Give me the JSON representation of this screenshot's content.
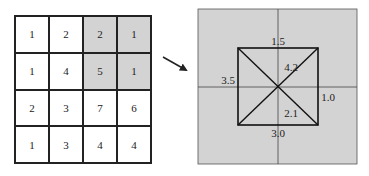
{
  "input_grid": {
    "rows": [
      [
        {
          "value": "1",
          "shaded": false
        },
        {
          "value": "2",
          "shaded": false
        },
        {
          "value": "2",
          "shaded": true
        },
        {
          "value": "1",
          "shaded": true
        }
      ],
      [
        {
          "value": "1",
          "shaded": false
        },
        {
          "value": "4",
          "shaded": false
        },
        {
          "value": "5",
          "shaded": true
        },
        {
          "value": "1",
          "shaded": true
        }
      ],
      [
        {
          "value": "2",
          "shaded": false
        },
        {
          "value": "3",
          "shaded": false
        },
        {
          "value": "7",
          "shaded": false
        },
        {
          "value": "6",
          "shaded": false
        }
      ],
      [
        {
          "value": "1",
          "shaded": false
        },
        {
          "value": "3",
          "shaded": false
        },
        {
          "value": "4",
          "shaded": false
        },
        {
          "value": "4",
          "shaded": false
        }
      ]
    ],
    "shade_color": "#d3d3d3"
  },
  "arrow": {
    "direction": "down-right"
  },
  "output_panel": {
    "background": "#d3d3d3",
    "labels": {
      "top": "1.5",
      "left": "3.5",
      "right": "1.0",
      "bottom": "3.0",
      "upper_right_diag": "4.2",
      "lower_right_diag": "2.1"
    }
  }
}
